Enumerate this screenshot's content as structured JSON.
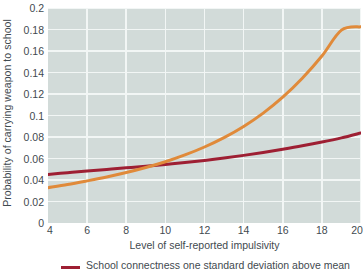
{
  "chart_data": {
    "type": "line",
    "title": "",
    "xlabel": "Level of self-reported impulsivity",
    "ylabel": "Probability of carrying weapon to school",
    "xlim": [
      4,
      20
    ],
    "ylim": [
      0,
      0.2
    ],
    "grid": true,
    "legend_position": "bottom",
    "xticks": [
      "4",
      "6",
      "8",
      "10",
      "12",
      "14",
      "16",
      "18",
      "20"
    ],
    "xtick_values": [
      4,
      6,
      8,
      10,
      12,
      14,
      16,
      18,
      20
    ],
    "yticks": [
      "0",
      "0.02",
      "0.04",
      "0.06",
      "0.08",
      "0.1",
      "0.12",
      "0.14",
      "0.16",
      "0.18",
      "0.2"
    ],
    "ytick_values": [
      0,
      0.02,
      0.04,
      0.06,
      0.08,
      0.1,
      0.12,
      0.14,
      0.16,
      0.18,
      0.2
    ],
    "x": [
      4,
      5,
      6,
      7,
      8,
      9,
      10,
      11,
      12,
      13,
      14,
      15,
      16,
      17,
      18,
      19,
      20
    ],
    "series": [
      {
        "name": "School connectness one standard deviation above mean",
        "color": "#9e1f33",
        "values": [
          0.0452,
          0.0468,
          0.0483,
          0.0498,
          0.0513,
          0.0528,
          0.0545,
          0.0562,
          0.0582,
          0.0604,
          0.0629,
          0.0656,
          0.0686,
          0.0718,
          0.0753,
          0.0792,
          0.0838
        ]
      },
      {
        "name": "School connectness one standard deviation below mean",
        "color": "#e08a3a",
        "values": [
          0.0328,
          0.0358,
          0.0392,
          0.0428,
          0.0469,
          0.0516,
          0.057,
          0.0633,
          0.0707,
          0.0794,
          0.0898,
          0.1022,
          0.117,
          0.1346,
          0.1553,
          0.1794,
          0.1825
        ]
      }
    ],
    "annotations": []
  },
  "legend": {
    "entries": [
      {
        "label": "School connectness one standard deviation above mean",
        "color": "#9e1f33"
      }
    ]
  },
  "colors": {
    "plot_background": "#d2dbd9",
    "gridline": "#f2f6f5",
    "text": "#3f4a4f",
    "series_above_mean": "#9e1f33",
    "series_below_mean": "#e08a3a"
  }
}
